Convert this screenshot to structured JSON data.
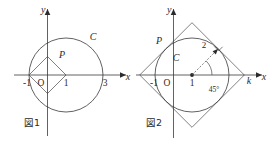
{
  "page": {
    "background_color": "#ffffff",
    "stroke_color": "#3a3a3a",
    "text_color": "#2b2b2b"
  },
  "figures": [
    {
      "id": "fig1",
      "caption": "図1",
      "axis_labels": {
        "x": "x",
        "y": "y",
        "origin": "O"
      },
      "x_ticks": [
        "-1",
        "1",
        "3"
      ],
      "shape_labels": {
        "circle": "C",
        "polygon": "P"
      },
      "geometry": {
        "circle": {
          "center_x": 1,
          "center_y": 0,
          "radius": 2
        },
        "polygon_vertices": [
          [
            -1,
            0
          ],
          [
            0,
            1
          ],
          [
            1,
            0
          ],
          [
            0,
            -1
          ]
        ]
      }
    },
    {
      "id": "fig2",
      "caption": "図2",
      "axis_labels": {
        "x": "x",
        "y": "y",
        "origin": "O"
      },
      "x_ticks": [
        "-1",
        "1",
        "k"
      ],
      "shape_labels": {
        "circle": "C",
        "polygon": "P"
      },
      "annotations": {
        "radius": "2",
        "angle": "45°"
      },
      "geometry": {
        "circle": {
          "center_x": 1,
          "center_y": 0,
          "radius": 2
        },
        "polygon_vertices": [
          [
            -1.83,
            0
          ],
          [
            1,
            2.83
          ],
          [
            3.83,
            0
          ],
          [
            1,
            -2.83
          ]
        ]
      }
    }
  ]
}
